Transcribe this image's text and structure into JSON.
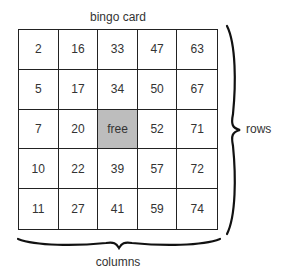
{
  "title": "bingo card",
  "rows_label": "rows",
  "columns_label": "columns",
  "free_color": "#bdbdbd",
  "grid": [
    [
      "2",
      "16",
      "33",
      "47",
      "63"
    ],
    [
      "5",
      "17",
      "34",
      "50",
      "67"
    ],
    [
      "7",
      "20",
      "free",
      "52",
      "71"
    ],
    [
      "10",
      "22",
      "39",
      "57",
      "72"
    ],
    [
      "11",
      "27",
      "41",
      "59",
      "74"
    ]
  ]
}
